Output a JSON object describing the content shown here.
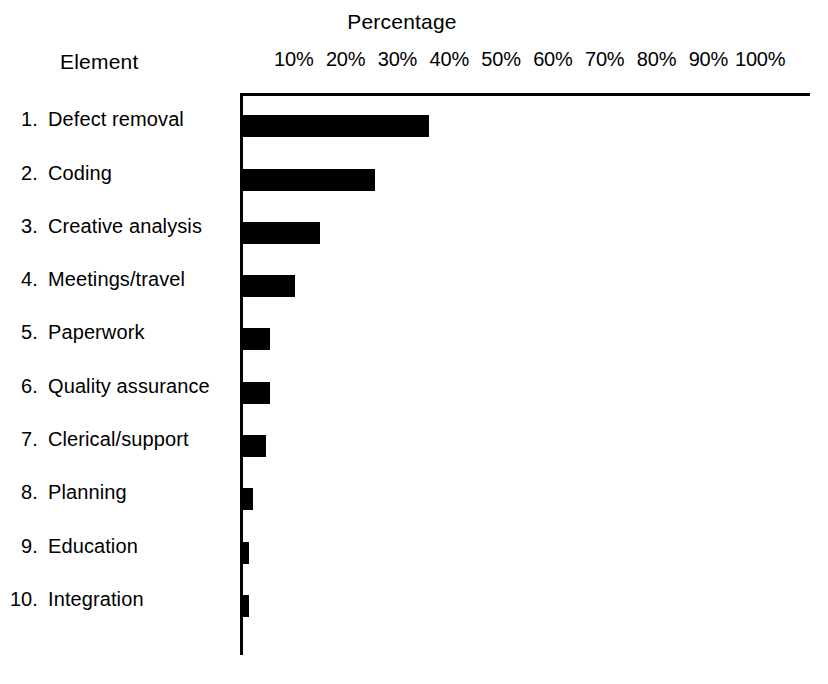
{
  "chart_data": {
    "type": "bar",
    "orientation": "horizontal",
    "title": "Percentage",
    "xlabel": "Percentage",
    "ylabel": "Element",
    "categories": [
      "Defect removal",
      "Coding",
      "Creative analysis",
      "Meetings/travel",
      "Paperwork",
      "Quality assurance",
      "Clerical/support",
      "Planning",
      "Education",
      "Integration"
    ],
    "category_numbers": [
      "1.",
      "2.",
      "3.",
      "4.",
      "5.",
      "6.",
      "7.",
      "8.",
      "9.",
      "10."
    ],
    "values": [
      36.5,
      26,
      15.5,
      10.7,
      5.7,
      5.7,
      5,
      2.5,
      1.8,
      1.8
    ],
    "value_unit": "%",
    "xlim": [
      0,
      110
    ],
    "xticks": [
      10,
      20,
      30,
      40,
      50,
      60,
      70,
      80,
      90,
      100
    ],
    "xtick_labels": [
      "10%",
      "20%",
      "30%",
      "40%",
      "50%",
      "60%",
      "70%",
      "80%",
      "90%",
      "100%"
    ],
    "grid": false,
    "legend": false,
    "bar_color": "#000000",
    "axis_color": "#000000",
    "background_color": "#ffffff"
  }
}
